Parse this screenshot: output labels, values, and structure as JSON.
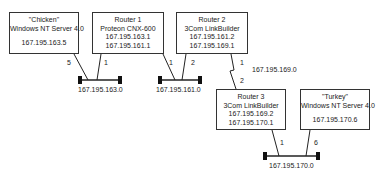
{
  "nodes": {
    "chicken": {
      "name": "\"Chicken\"",
      "os": "Windows NT Server 4.0",
      "ip": "167.195.163.5"
    },
    "router1": {
      "name": "Router 1",
      "model": "Proteon CNX-600",
      "ip1": "167.195.163.1",
      "ip2": "167.195.161.1"
    },
    "router2": {
      "name": "Router 2",
      "model": "3Com LinkBuilder",
      "ip1": "167.195.161.2",
      "ip2": "167.195.169.1"
    },
    "router3": {
      "name": "Router 3",
      "model": "3Com LinkBuilder",
      "ip1": "167.195.169.2",
      "ip2": "167.195.170.1"
    },
    "turkey": {
      "name": "\"Turkey\"",
      "os": "Windows NT Server 4.0",
      "ip": "167.195.170.6"
    }
  },
  "segments": {
    "net163": "167.195.163.0",
    "net161": "167.195.161.0",
    "net169": "167.195.169.0",
    "net170": "167.195.170.0"
  },
  "ports": {
    "chicken_163": "5",
    "router1_163": "1",
    "router1_161": "1",
    "router2_161": "2",
    "router2_169": "1",
    "router3_169": "2",
    "router3_170": "1",
    "turkey_170": "6"
  },
  "colors": {
    "line": "#333333",
    "terminator": "#111111",
    "background": "#ffffff"
  }
}
